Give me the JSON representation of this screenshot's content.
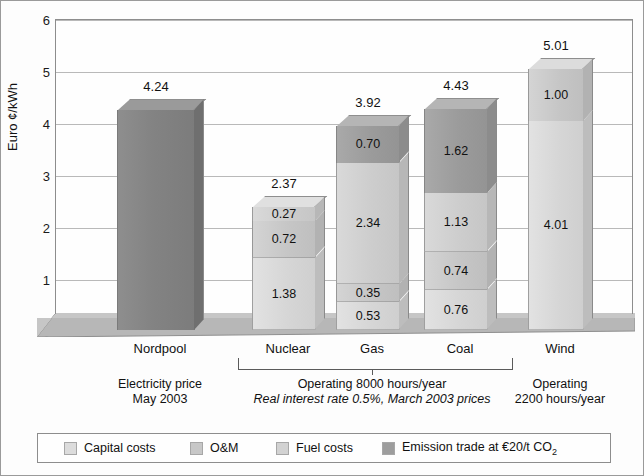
{
  "chart_data": {
    "type": "bar",
    "subtype": "stacked-3d-column",
    "title": "",
    "xlabel": "",
    "ylabel": "Euro ¢/kWh",
    "ylim": [
      0,
      6
    ],
    "yticks": [
      "0",
      "1",
      "2",
      "3",
      "4",
      "5",
      "6"
    ],
    "grid": true,
    "legend_position": "bottom",
    "categories": [
      "Nordpool",
      "Nuclear",
      "Gas",
      "Coal",
      "Wind"
    ],
    "totals": [
      "4.24",
      "2.37",
      "3.92",
      "4.43",
      "5.01"
    ],
    "series": [
      {
        "name": "Capital costs",
        "key": "capital",
        "color": "#dcdcdc",
        "values": [
          null,
          1.38,
          0.53,
          0.76,
          4.01
        ]
      },
      {
        "name": "O&M",
        "key": "om",
        "color": "#c7c7c7",
        "values": [
          null,
          0.72,
          0.35,
          0.74,
          1.0
        ]
      },
      {
        "name": "Fuel costs",
        "key": "fuel",
        "color": "#d2d2d2",
        "values": [
          null,
          0.27,
          2.34,
          1.13,
          null
        ]
      },
      {
        "name": "Emission trade at €20/t CO₂",
        "key": "emission",
        "color": "#9d9d9d",
        "values": [
          4.24,
          null,
          0.7,
          1.62,
          null
        ]
      }
    ],
    "bars": [
      {
        "category": "Nordpool",
        "total": "4.24",
        "segments": [
          {
            "series": "spot",
            "value": 4.24,
            "label": ""
          }
        ]
      },
      {
        "category": "Nuclear",
        "total": "2.37",
        "segments": [
          {
            "series": "capital",
            "value": 1.38,
            "label": "1.38"
          },
          {
            "series": "om",
            "value": 0.72,
            "label": "0.72"
          },
          {
            "series": "fuel",
            "value": 0.27,
            "label": "0.27"
          }
        ]
      },
      {
        "category": "Gas",
        "total": "3.92",
        "segments": [
          {
            "series": "capital",
            "value": 0.53,
            "label": "0.53"
          },
          {
            "series": "om",
            "value": 0.35,
            "label": "0.35"
          },
          {
            "series": "fuel",
            "value": 2.34,
            "label": "2.34"
          },
          {
            "series": "emission",
            "value": 0.7,
            "label": "0.70"
          }
        ]
      },
      {
        "category": "Coal",
        "total": "4.43",
        "segments": [
          {
            "series": "capital",
            "value": 0.76,
            "label": "0.76"
          },
          {
            "series": "om",
            "value": 0.74,
            "label": "0.74"
          },
          {
            "series": "fuel",
            "value": 1.13,
            "label": "1.13"
          },
          {
            "series": "emission",
            "value": 1.62,
            "label": "1.62"
          }
        ]
      },
      {
        "category": "Wind",
        "total": "5.01",
        "segments": [
          {
            "series": "capital",
            "value": 4.01,
            "label": "4.01"
          },
          {
            "series": "om",
            "value": 1.0,
            "label": "1.00"
          }
        ]
      }
    ],
    "annotations": [
      {
        "id": "nordpool-note",
        "line1": "Electricity price",
        "line2": "May 2003",
        "italic2": false
      },
      {
        "id": "thermal-note",
        "line1": "Operating 8000 hours/year",
        "line2": "Real interest rate 0.5%, March 2003 prices",
        "italic2": true
      },
      {
        "id": "wind-note",
        "line1": "Operating",
        "line2": "2200 hours/year",
        "italic2": false
      }
    ],
    "bracket": {
      "spans": [
        "Nuclear",
        "Coal"
      ],
      "tick_at": "Gas"
    }
  },
  "legend": {
    "items": [
      {
        "label": "Capital costs",
        "swatch": "sw-capital"
      },
      {
        "label": "O&M",
        "swatch": "sw-om"
      },
      {
        "label": "Fuel costs",
        "swatch": "sw-fuel"
      },
      {
        "label": "Emission trade at €20/t CO",
        "sub": "2",
        "swatch": "sw-emis"
      }
    ]
  }
}
